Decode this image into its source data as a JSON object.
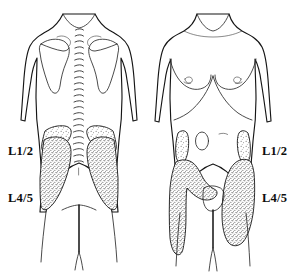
{
  "figure": {
    "background_color": "#ffffff",
    "line_color": "#151515",
    "stipple_color": "#3a3a3a",
    "views": [
      {
        "id": "posterior",
        "name": "Posterior view",
        "description": "Back view of torso showing scapulae, spinal column and stippled pain referral zones over the lumbar and gluteal region",
        "labels": [
          {
            "id": "posterior-l12",
            "text": "L1/2",
            "side": "left",
            "x": 8,
            "y": 150
          },
          {
            "id": "posterior-l45",
            "text": "L4/5",
            "side": "left",
            "x": 8,
            "y": 198
          }
        ]
      },
      {
        "id": "anterior",
        "name": "Anterior view",
        "description": "Front view of torso showing chest, umbilicus, groin and stippled pain referral zones over the inguinal region and anterior thigh",
        "labels": [
          {
            "id": "anterior-l12",
            "text": "L1/2",
            "side": "right",
            "x": 262,
            "y": 150
          },
          {
            "id": "anterior-l45",
            "text": "L4/5",
            "side": "right",
            "x": 262,
            "y": 198
          }
        ]
      }
    ],
    "legend_levels": [
      {
        "code": "L1/2",
        "meaning": "First-second lumbar disc level referral zone"
      },
      {
        "code": "L4/5",
        "meaning": "Fourth-fifth lumbar disc level referral zone"
      }
    ]
  }
}
